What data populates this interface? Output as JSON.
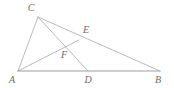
{
  "figure": {
    "type": "geometry-diagram",
    "canvas": {
      "width": 174,
      "height": 88,
      "background": "#ffffff"
    },
    "style": {
      "line_color": "#a8a8a8",
      "baseline_color": "#c0c0c0",
      "label_color": "#6b6b6b",
      "line_width": 0.8,
      "baseline_width": 1.6,
      "label_font_size": 10,
      "label_font_style": "italic-serif"
    },
    "points": [
      {
        "id": "A",
        "label": "A",
        "x": 18,
        "y": 71,
        "label_x": 12,
        "label_y": 80,
        "on": "base-left-vertex"
      },
      {
        "id": "B",
        "label": "B",
        "x": 160,
        "y": 71,
        "label_x": 158,
        "label_y": 80,
        "on": "base-right-vertex"
      },
      {
        "id": "C",
        "label": "C",
        "x": 38,
        "y": 17,
        "label_x": 31,
        "label_y": 8,
        "on": "apex"
      },
      {
        "id": "D",
        "label": "D",
        "x": 88,
        "y": 71,
        "label_x": 88,
        "label_y": 80,
        "on": "segment-AB"
      },
      {
        "id": "E",
        "label": "E",
        "x": 79,
        "y": 40,
        "label_x": 86,
        "label_y": 30,
        "on": "segment-CB"
      },
      {
        "id": "F",
        "label": "F",
        "x": 63,
        "y": 46,
        "label_x": 64,
        "label_y": 55,
        "on": "intersection-CD-AE"
      }
    ],
    "segments": [
      {
        "id": "AB",
        "from": "A",
        "to": "B",
        "role": "base",
        "emphasis": "thick"
      },
      {
        "id": "AC",
        "from": "A",
        "to": "C",
        "role": "side",
        "emphasis": "normal"
      },
      {
        "id": "CB",
        "from": "C",
        "to": "B",
        "role": "side",
        "emphasis": "normal"
      },
      {
        "id": "CD",
        "from": "C",
        "to": "D",
        "role": "cevian",
        "emphasis": "normal"
      },
      {
        "id": "AE",
        "from": "A",
        "to": "E",
        "role": "cevian",
        "emphasis": "normal"
      }
    ]
  }
}
